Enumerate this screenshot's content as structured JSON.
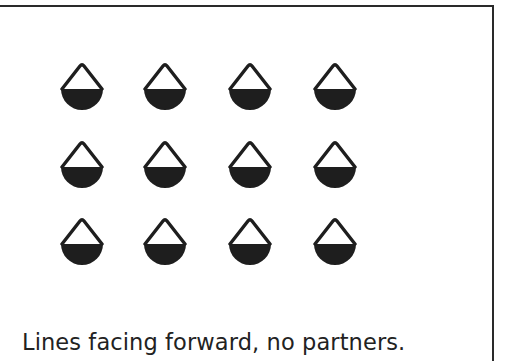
{
  "figure": {
    "caption": "Lines facing forward, no partners.",
    "layout": {
      "rows": 3,
      "columns": 4,
      "column_centers_x": [
        82,
        165,
        250,
        335
      ],
      "row_tops_y": [
        63,
        141,
        218
      ],
      "facing": "forward",
      "partners": false
    },
    "symbol": {
      "name": "dancer-icon",
      "description": "triangle outline atop filled semicircle",
      "color": "#1e1e1e"
    },
    "dancers": [
      {
        "row": 1,
        "col": 1
      },
      {
        "row": 1,
        "col": 2
      },
      {
        "row": 1,
        "col": 3
      },
      {
        "row": 1,
        "col": 4
      },
      {
        "row": 2,
        "col": 1
      },
      {
        "row": 2,
        "col": 2
      },
      {
        "row": 2,
        "col": 3
      },
      {
        "row": 2,
        "col": 4
      },
      {
        "row": 3,
        "col": 1
      },
      {
        "row": 3,
        "col": 2
      },
      {
        "row": 3,
        "col": 3
      },
      {
        "row": 3,
        "col": 4
      }
    ]
  }
}
